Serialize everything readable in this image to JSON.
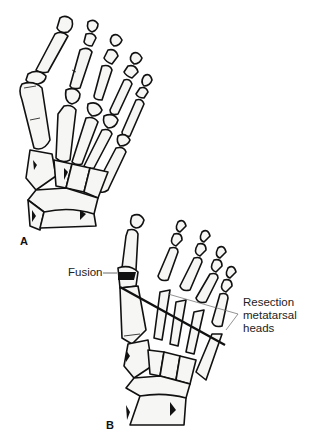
{
  "figure": {
    "panel_a": {
      "label": "A",
      "title": "Normal foot skeleton (dorsal view)"
    },
    "panel_b": {
      "label": "B",
      "annotations": {
        "fusion": "Fusion",
        "resection_line1": "Resection",
        "resection_line2": "metatarsal",
        "resection_line3": "heads"
      }
    },
    "caption": "",
    "colors": {
      "line": "#111111",
      "bone_fill": "#f6f6f4",
      "text": "#222222"
    }
  }
}
